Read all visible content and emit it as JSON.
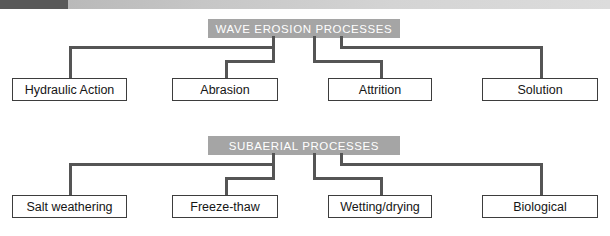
{
  "topbar": {
    "dark_color": "#595959",
    "light_color": "#cfcfcf"
  },
  "charts": [
    {
      "id": "wave-erosion",
      "title": "WAVE EROSION PROCESSES",
      "title_bg": "#a5a5a5",
      "title_color": "#ffffff",
      "leaves": [
        {
          "label": "Hydraulic Action"
        },
        {
          "label": "Abrasion"
        },
        {
          "label": "Attrition"
        },
        {
          "label": "Solution"
        }
      ]
    },
    {
      "id": "subaerial",
      "title": "SUBAERIAL PROCESSES",
      "title_bg": "#a5a5a5",
      "title_color": "#ffffff",
      "leaves": [
        {
          "label": "Salt weathering"
        },
        {
          "label": "Freeze-thaw"
        },
        {
          "label": "Wetting/drying"
        },
        {
          "label": "Biological"
        }
      ]
    }
  ]
}
